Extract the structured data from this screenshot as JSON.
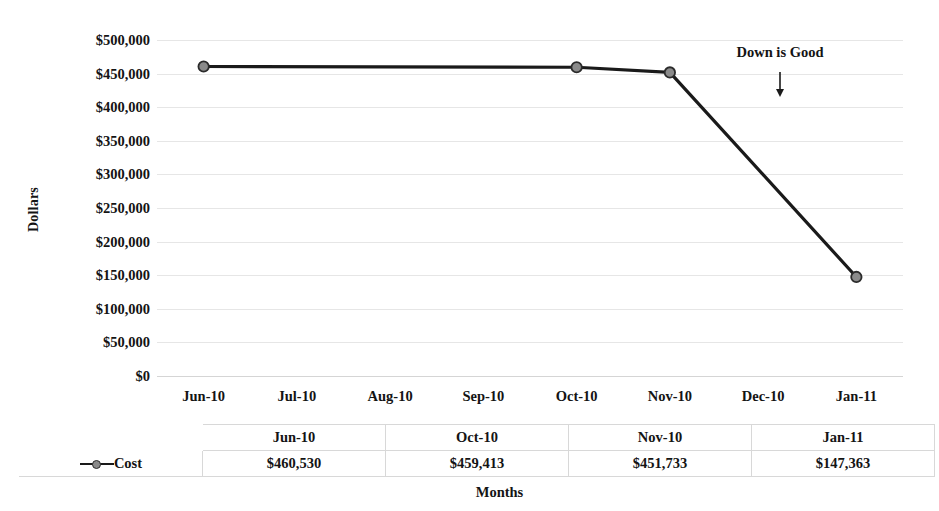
{
  "chart_data": {
    "type": "line",
    "title": "",
    "xlabel": "Months",
    "ylabel": "Dollars",
    "categories": [
      "Jun-10",
      "Jul-10",
      "Aug-10",
      "Sep-10",
      "Oct-10",
      "Nov-10",
      "Dec-10",
      "Jan-11"
    ],
    "series": [
      {
        "name": "Cost",
        "points": [
          {
            "x": "Jun-10",
            "y": 460530,
            "label": "$460,530"
          },
          {
            "x": "Oct-10",
            "y": 459413,
            "label": "$459,413"
          },
          {
            "x": "Nov-10",
            "y": 451733,
            "label": "$451,733"
          },
          {
            "x": "Jan-11",
            "y": 147363,
            "label": "$147,363"
          }
        ],
        "color": "#1a1a1a",
        "marker_fill": "#8a8a8a"
      }
    ],
    "ylim": [
      0,
      500000
    ],
    "ytick_labels": [
      "$500,000",
      "$450,000",
      "$400,000",
      "$350,000",
      "$300,000",
      "$250,000",
      "$200,000",
      "$150,000",
      "$100,000",
      "$50,000",
      "$0"
    ],
    "ytick_values": [
      500000,
      450000,
      400000,
      350000,
      300000,
      250000,
      200000,
      150000,
      100000,
      50000,
      0
    ],
    "grid": true,
    "legend_position": "bottom-table",
    "annotations": [
      {
        "text": "Down is Good",
        "icon": "down-arrow"
      }
    ],
    "data_table": {
      "row_label": "Cost",
      "headers": [
        "Jun-10",
        "Oct-10",
        "Nov-10",
        "Jan-11"
      ],
      "values": [
        "$460,530",
        "$459,413",
        "$451,733",
        "$147,363"
      ]
    }
  },
  "annotation": {
    "text": "Down is Good",
    "arrow_icon": "down-arrow-icon"
  }
}
